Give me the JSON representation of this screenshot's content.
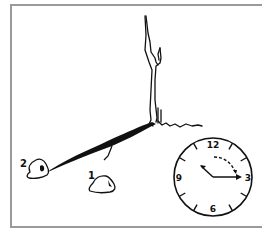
{
  "figure": {
    "rocks": [
      {
        "id": "rock-1",
        "label": "1"
      },
      {
        "id": "rock-2",
        "label": "2"
      }
    ],
    "clock": {
      "numerals": {
        "top": "12",
        "right": "3",
        "bottom": "6",
        "left": "9"
      },
      "hour_hand_points_to": "10",
      "minute_hand_points_to": "3",
      "arrow": "dashed arc from 12 toward 3 (clockwise)"
    },
    "colors": {
      "ink": "#111111",
      "frame": "#9a9a9a",
      "background": "#ffffff"
    }
  }
}
